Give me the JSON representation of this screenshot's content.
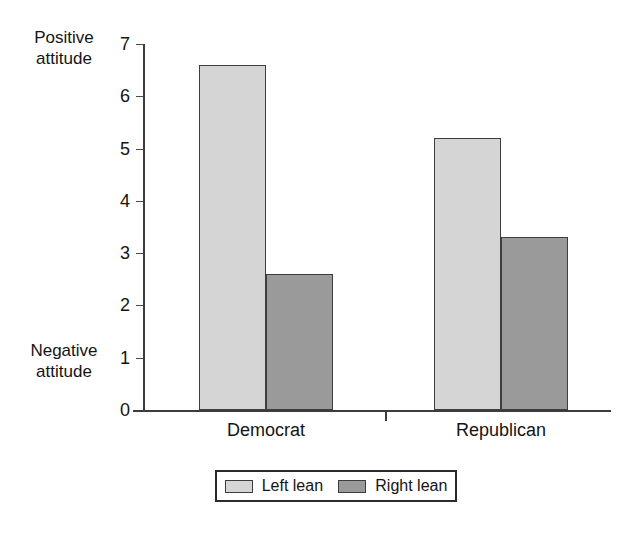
{
  "chart_data": {
    "type": "bar",
    "title": "",
    "subtitle": "",
    "xlabel": "",
    "ylabel": "",
    "categories": [
      "Democrat",
      "Republican"
    ],
    "series": [
      {
        "name": "Left lean",
        "values": [
          6.6,
          5.2
        ],
        "color": "#d5d5d5"
      },
      {
        "name": "Right lean",
        "values": [
          2.6,
          3.3
        ],
        "color": "#9a9a9a"
      }
    ],
    "series_order_note": "Within each category the Left lean bar is drawn first (left), Right lean second (right)",
    "bars": [
      {
        "category": "Democrat",
        "series": "Left lean",
        "value": 6.6
      },
      {
        "category": "Democrat",
        "series": "Right lean",
        "value": 5.2
      },
      {
        "category": "Republican",
        "series": "Left lean",
        "value": 2.6
      },
      {
        "category": "Republican",
        "series": "Right lean",
        "value": 3.3
      }
    ],
    "ylim": [
      0,
      7
    ],
    "yticks": [
      0,
      1,
      2,
      3,
      4,
      5,
      6,
      7
    ],
    "ytick_labels": [
      "0",
      "1",
      "2",
      "3",
      "4",
      "5",
      "6",
      "7"
    ],
    "grid": false,
    "legend_position": "bottom",
    "annotations": [
      {
        "name": "positive-attitude",
        "text": "Positive\nattitude",
        "at_value": 7,
        "side": "left"
      },
      {
        "name": "negative-attitude",
        "text": "Negative\nattitude",
        "at_value": 0,
        "side": "left"
      }
    ]
  },
  "axis": {
    "positive_label_line1": "Positive",
    "positive_label_line2": "attitude",
    "negative_label_line1": "Negative",
    "negative_label_line2": "attitude"
  },
  "legend": {
    "items": [
      {
        "label": "Left lean",
        "color": "#d5d5d5"
      },
      {
        "label": "Right lean",
        "color": "#9a9a9a"
      }
    ]
  },
  "colors": {
    "left_lean": "#d5d5d5",
    "right_lean": "#9a9a9a",
    "bar_border": "#3d3d3d",
    "axis": "#3c3c3c",
    "text": "#141414",
    "background": "#ffffff"
  }
}
